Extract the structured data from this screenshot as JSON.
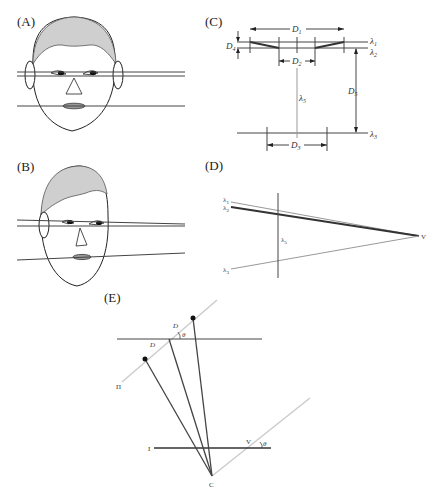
{
  "panels": {
    "A": {
      "label": "(A)"
    },
    "B": {
      "label": "(B)"
    },
    "C": {
      "label": "(C)",
      "dims": {
        "d1": "D",
        "d1_sub": "1",
        "d2": "D",
        "d2_sub": "2",
        "d3": "D",
        "d3_sub": "3",
        "d4": "D",
        "d4_sub": "4",
        "d5": "D",
        "d5_sub": "5"
      },
      "lines": {
        "l1": "λ",
        "l1_sub": "1",
        "l2": "λ",
        "l2_sub": "2",
        "l3": "λ",
        "l3_sub": "3",
        "l5": "λ",
        "l5_sub": "5"
      }
    },
    "D": {
      "label": "(D)",
      "lines": {
        "l1": "λ",
        "l1_sub": "1",
        "l2": "λ",
        "l2_sub": "2",
        "l3": "λ",
        "l3_sub": "3",
        "l5": "λ",
        "l5_sub": "5"
      },
      "vanishing_point": "V"
    },
    "E": {
      "label": "(E)",
      "picture_plane": "Π",
      "d_upper": "D",
      "d_lower": "D",
      "theta_upper": "θ",
      "theta_lower": "θ",
      "image_line": "I",
      "vanishing_point": "V",
      "center": "C"
    }
  }
}
